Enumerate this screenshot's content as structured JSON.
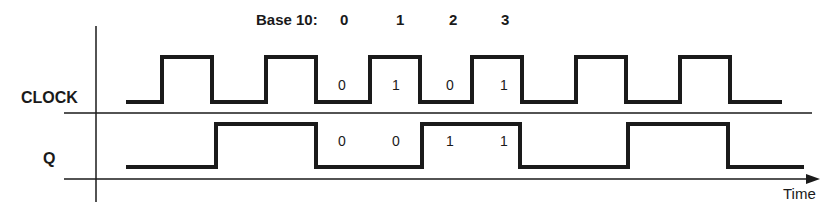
{
  "header": {
    "base_label": "Base 10:",
    "counts": [
      "0",
      "1",
      "2",
      "3"
    ]
  },
  "signals": {
    "clock_label": "CLOCK",
    "q_label": "Q"
  },
  "clock_bits": [
    "0",
    "1",
    "0",
    "1"
  ],
  "q_bits": [
    "0",
    "0",
    "1",
    "1"
  ],
  "axis": {
    "time_label": "Time"
  },
  "colors": {
    "line": "#1a1a1a",
    "background": "#ffffff"
  }
}
